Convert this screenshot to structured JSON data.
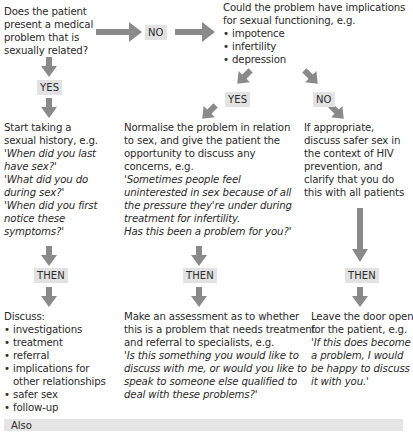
{
  "start_question": {
    "lines": [
      "Does the patient",
      "present a medical",
      "problem that is",
      "sexually related?"
    ]
  },
  "labels": {
    "no_top": "NO",
    "yes_left": "YES",
    "yes_mid": "YES",
    "no_right": "NO",
    "then_left": "THEN",
    "then_mid": "THEN",
    "then_right": "THEN"
  },
  "implications_question": {
    "lines": [
      "Could the problem have implications",
      "for sexual functioning, e.g."
    ],
    "bullets": [
      "impotence",
      "infertility",
      "depression"
    ]
  },
  "sexual_history": {
    "lines": [
      "Start taking a",
      "sexual history, e.g."
    ],
    "italic_lines": [
      "'When did you last",
      "have sex?'",
      "'What did you do",
      "during sex?'",
      "'When did you first",
      "notice these",
      "symptoms?'"
    ]
  },
  "normalise": {
    "lines": [
      "Normalise the problem in relation",
      "to sex, and give the patient the",
      "opportunity to discuss any",
      "concerns, e.g."
    ],
    "italic_lines": [
      "'Sometimes people feel",
      "uninterested in sex because of all",
      "the pressure they're under during",
      "treatment for infertility.",
      "Has this been a problem for you?'"
    ]
  },
  "safer_sex": {
    "lines": [
      "If appropriate,",
      "discuss safer sex in",
      "the context of HIV",
      "prevention, and",
      "clarify that you do",
      "this with all patients"
    ]
  },
  "discuss": {
    "heading": "Discuss:",
    "bullets": [
      [
        "investigations"
      ],
      [
        "treatment"
      ],
      [
        "referral"
      ],
      [
        "implications for",
        "other relationships"
      ],
      [
        "safer sex"
      ],
      [
        "follow-up"
      ]
    ]
  },
  "assessment": {
    "lines": [
      "Make an assessment as to whether",
      "this is a problem that needs treatment",
      "and referral to specialists, e.g."
    ],
    "italic_lines": [
      "'Is this something you would like to",
      "discuss with me, or would you like to",
      "speak to someone else qualified to",
      "deal with these problems?'"
    ]
  },
  "door_open": {
    "lines": [
      "Leave the door open",
      "for the patient, e.g."
    ],
    "italic_lines": [
      "'If this does become",
      "a problem, I would",
      "be happy to discuss",
      "it with you.'"
    ]
  },
  "also_box": {
    "label": "Also"
  },
  "colors": {
    "arrow": "#8a8a8a",
    "tag_bg": "#e2e2e2",
    "also_bg": "#e5e5e5",
    "text": "#2a2a2a"
  }
}
